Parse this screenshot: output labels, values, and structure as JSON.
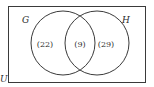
{
  "diagram": {
    "type": "venn",
    "universe_label": "U",
    "sets": [
      {
        "label": "G",
        "only_count": "(22)"
      },
      {
        "label": "H",
        "only_count": "(29)"
      }
    ],
    "intersection_count": "(9)",
    "colors": {
      "stroke": "#3a3a3a",
      "text": "#2a2a2a",
      "background": "#ffffff"
    }
  }
}
